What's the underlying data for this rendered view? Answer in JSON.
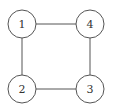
{
  "diagram": {
    "type": "graph",
    "nodes": [
      {
        "id": "1",
        "label": "1",
        "cx": 22,
        "cy": 24
      },
      {
        "id": "4",
        "label": "4",
        "cx": 90,
        "cy": 24
      },
      {
        "id": "2",
        "label": "2",
        "cx": 22,
        "cy": 89
      },
      {
        "id": "3",
        "label": "3",
        "cx": 90,
        "cy": 89
      }
    ],
    "edges": [
      {
        "from": "1",
        "to": "4"
      },
      {
        "from": "1",
        "to": "2"
      },
      {
        "from": "4",
        "to": "3"
      },
      {
        "from": "2",
        "to": "3"
      }
    ],
    "node_radius": 14,
    "colors": {
      "stroke": "#555555",
      "fill": "#ffffff",
      "text": "#333333"
    }
  }
}
